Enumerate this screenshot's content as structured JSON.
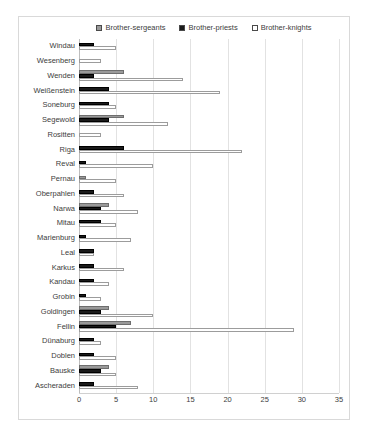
{
  "chart_data": {
    "type": "bar",
    "orientation": "horizontal",
    "title": "",
    "subtitle": "",
    "xlabel": "",
    "ylabel": "",
    "xlim": [
      0,
      35
    ],
    "xticks": [
      0,
      5,
      10,
      15,
      20,
      25,
      30,
      35
    ],
    "grid": true,
    "legend_position": "top-center",
    "categories": [
      "Windau",
      "Wesenberg",
      "Wenden",
      "Weißenstein",
      "Soneburg",
      "Segewold",
      "Rositten",
      "Riga",
      "Reval",
      "Pernau",
      "Oberpahlen",
      "Narwa",
      "Mitau",
      "Marienburg",
      "Leal",
      "Karkus",
      "Kandau",
      "Grobin",
      "Goldingen",
      "Fellin",
      "Dünaburg",
      "Doblen",
      "Bauske",
      "Ascheraden"
    ],
    "series": [
      {
        "name": "Brother-sergeants",
        "color": "#9a9a9a",
        "values": [
          0,
          0,
          6,
          0,
          0,
          6,
          0,
          0,
          0,
          1,
          0,
          4,
          0,
          0,
          0,
          0,
          0,
          0,
          4,
          7,
          0,
          0,
          4,
          0
        ]
      },
      {
        "name": "Brother-priests",
        "color": "#1a1a1a",
        "values": [
          2,
          0,
          2,
          4,
          4,
          4,
          0,
          6,
          1,
          0,
          2,
          3,
          3,
          1,
          2,
          2,
          2,
          1,
          3,
          5,
          2,
          2,
          3,
          2
        ]
      },
      {
        "name": "Brother-knights",
        "color": "#ffffff",
        "values": [
          5,
          3,
          14,
          19,
          5,
          12,
          3,
          22,
          10,
          5,
          6,
          8,
          5,
          7,
          2,
          6,
          4,
          3,
          10,
          29,
          3,
          5,
          5,
          8
        ]
      }
    ]
  }
}
